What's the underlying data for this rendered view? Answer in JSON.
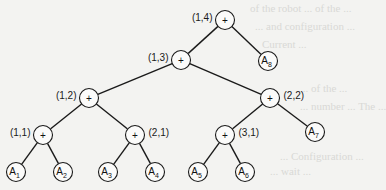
{
  "diagram": {
    "type": "binary-tree",
    "colors": {
      "background": "#f3f3f1",
      "stroke": "#1a1a1a",
      "node_fill": "#fbfbfa"
    },
    "nodes": [
      {
        "id": "n14",
        "kind": "op",
        "symbol": "+",
        "label": "(1,4)",
        "x": 225,
        "y": 20,
        "label_side": "left"
      },
      {
        "id": "n13",
        "kind": "op",
        "symbol": "+",
        "label": "(1,3)",
        "x": 181,
        "y": 60,
        "label_side": "left"
      },
      {
        "id": "n12",
        "kind": "op",
        "symbol": "+",
        "label": "(1,2)",
        "x": 89,
        "y": 98,
        "label_side": "left"
      },
      {
        "id": "n22",
        "kind": "op",
        "symbol": "+",
        "label": "(2,2)",
        "x": 270,
        "y": 98,
        "label_side": "right"
      },
      {
        "id": "n11",
        "kind": "op",
        "symbol": "+",
        "label": "(1,1)",
        "x": 43,
        "y": 135,
        "label_side": "left"
      },
      {
        "id": "n21",
        "kind": "op",
        "symbol": "+",
        "label": "(2,1)",
        "x": 135,
        "y": 135,
        "label_side": "right"
      },
      {
        "id": "n31",
        "kind": "op",
        "symbol": "+",
        "label": "(3,1)",
        "x": 225,
        "y": 135,
        "label_side": "right"
      },
      {
        "id": "A1",
        "kind": "leaf",
        "base": "A",
        "sub": "1",
        "x": 16,
        "y": 172
      },
      {
        "id": "A2",
        "kind": "leaf",
        "base": "A",
        "sub": "2",
        "x": 63,
        "y": 172
      },
      {
        "id": "A3",
        "kind": "leaf",
        "base": "A",
        "sub": "3",
        "x": 108,
        "y": 172
      },
      {
        "id": "A4",
        "kind": "leaf",
        "base": "A",
        "sub": "4",
        "x": 155,
        "y": 172
      },
      {
        "id": "A5",
        "kind": "leaf",
        "base": "A",
        "sub": "5",
        "x": 198,
        "y": 172
      },
      {
        "id": "A6",
        "kind": "leaf",
        "base": "A",
        "sub": "6",
        "x": 245,
        "y": 172
      },
      {
        "id": "A7",
        "kind": "leaf",
        "base": "A",
        "sub": "7",
        "x": 315,
        "y": 132
      },
      {
        "id": "A8",
        "kind": "leaf",
        "base": "A",
        "sub": "8",
        "x": 268,
        "y": 61
      }
    ],
    "edges": [
      [
        "n14",
        "n13"
      ],
      [
        "n14",
        "A8"
      ],
      [
        "n13",
        "n12"
      ],
      [
        "n13",
        "n22"
      ],
      [
        "n12",
        "n11"
      ],
      [
        "n12",
        "n21"
      ],
      [
        "n22",
        "n31"
      ],
      [
        "n22",
        "A7"
      ],
      [
        "n11",
        "A1"
      ],
      [
        "n11",
        "A2"
      ],
      [
        "n21",
        "A3"
      ],
      [
        "n21",
        "A4"
      ],
      [
        "n31",
        "A5"
      ],
      [
        "n31",
        "A6"
      ]
    ]
  },
  "background_text": [
    {
      "text": "of the robot ... of the ...",
      "x": 250,
      "y": 2
    },
    {
      "text": "... and configuration ...",
      "x": 255,
      "y": 20
    },
    {
      "text": "Current ... ",
      "x": 262,
      "y": 38
    },
    {
      "text": "... of the ... ",
      "x": 300,
      "y": 82
    },
    {
      "text": "... number ... The ...",
      "x": 300,
      "y": 100
    },
    {
      "text": "... Configuration ...",
      "x": 280,
      "y": 150
    },
    {
      "text": "... wait ... ",
      "x": 270,
      "y": 165
    }
  ]
}
